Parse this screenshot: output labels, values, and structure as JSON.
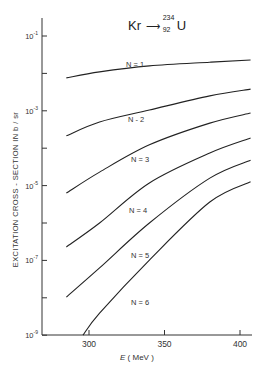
{
  "chart_data": {
    "type": "line",
    "title_parts": {
      "projectile": "Kr",
      "arrow": "→",
      "mass_number": "234",
      "atomic_number": "92",
      "target": "U"
    },
    "xlabel": "E (MeV)",
    "xlabel_parts": {
      "symbol": "E",
      "unit": "( MeV )"
    },
    "ylabel": "EXCITATION  CROSS - SECTION  IN  b / sr",
    "yscale": "log",
    "xlim": [
      270,
      410
    ],
    "ylim": [
      1e-09,
      0.1
    ],
    "x_ticks": [
      300,
      350,
      400
    ],
    "x_tick_labels": [
      "300",
      "350",
      "400"
    ],
    "y_ticks_major": [
      0.1,
      0.001,
      1e-05,
      1e-07,
      1e-09
    ],
    "y_tick_labels": [
      {
        "base": "10",
        "exp": "-1"
      },
      {
        "base": "10",
        "exp": "-3"
      },
      {
        "base": "10",
        "exp": "-5"
      },
      {
        "base": "10",
        "exp": "-7"
      },
      {
        "base": "10",
        "exp": "-9"
      }
    ],
    "y_ticks_minor": [
      0.01,
      0.0001,
      1e-06,
      1e-08
    ],
    "grid": false,
    "legend": "inline curve labels",
    "series": [
      {
        "name": "N = 1",
        "x": [
          285,
          307,
          340,
          380,
          407
        ],
        "log10_y": [
          -2.12,
          -1.96,
          -1.8,
          -1.7,
          -1.64
        ]
      },
      {
        "name": "N = 2",
        "x": [
          285,
          307,
          340,
          380,
          407
        ],
        "log10_y": [
          -3.67,
          -3.3,
          -2.98,
          -2.6,
          -2.42
        ]
      },
      {
        "name": "N = 3",
        "x": [
          285,
          307,
          340,
          380,
          407
        ],
        "log10_y": [
          -5.2,
          -4.64,
          -3.91,
          -3.33,
          -3.06
        ]
      },
      {
        "name": "N = 4",
        "x": [
          285,
          307,
          340,
          380,
          407
        ],
        "log10_y": [
          -6.64,
          -6.0,
          -4.93,
          -4.13,
          -3.73
        ]
      },
      {
        "name": "N = 5",
        "x": [
          285,
          307,
          340,
          380,
          407
        ],
        "log10_y": [
          -7.98,
          -7.2,
          -6.0,
          -4.8,
          -4.32
        ]
      },
      {
        "name": "N = 6",
        "x": [
          296,
          307,
          340,
          380,
          407
        ],
        "log10_y": [
          -9.0,
          -8.41,
          -6.99,
          -5.44,
          -4.9
        ]
      }
    ]
  },
  "curve_labels": [
    "N = 1",
    "N - 2",
    "N = 3",
    "N = 4",
    "N = 5",
    "N = 6"
  ]
}
